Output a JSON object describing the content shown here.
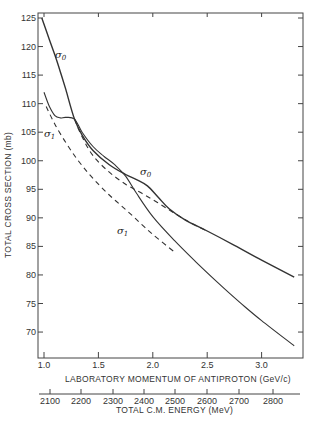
{
  "chart_data": {
    "type": "line",
    "title": "",
    "ylabel": "TOTAL CROSS SECTION (mb)",
    "xlabel": "LABORATORY MOMENTUM OF ANTIPROTON (GeV/c)",
    "x2label": "TOTAL C.M. ENERGY (MeV)",
    "xlim": [
      0.95,
      3.35
    ],
    "ylim": [
      65.5,
      125.5
    ],
    "x_ticks": [
      "1.0",
      "1.5",
      "2.0",
      "2.5",
      "3.0"
    ],
    "y_ticks": [
      "125",
      "120",
      "115",
      "110",
      "105",
      "100",
      "95",
      "90",
      "85",
      "80",
      "75",
      "70"
    ],
    "x2_ticks": [
      "2100",
      "2200",
      "2300",
      "2400",
      "2500",
      "2600",
      "2700",
      "2800"
    ],
    "grid": false,
    "legend": null,
    "annotations": [
      {
        "text": "σ0",
        "x": 1.1,
        "y": 118
      },
      {
        "text": "σ1",
        "x": 1.05,
        "y": 104
      },
      {
        "text": "σ0",
        "x": 1.98,
        "y": 97
      },
      {
        "text": "σ1",
        "x": 1.97,
        "y": 90
      }
    ],
    "series": [
      {
        "name": "σ0 (solid)",
        "style": "solid",
        "x": [
          0.98,
          1.05,
          1.1,
          1.15,
          1.2,
          1.28,
          1.35,
          1.45,
          1.6,
          1.75,
          1.85,
          1.95,
          2.05,
          2.15,
          2.3,
          2.5,
          2.75,
          3.0,
          3.3
        ],
        "y": [
          125,
          121.2,
          118.5,
          115.6,
          112.5,
          107.3,
          104.5,
          101.8,
          99.3,
          97.6,
          96.7,
          95.6,
          93.6,
          91.6,
          89.6,
          87.7,
          85.2,
          82.6,
          79.6
        ]
      },
      {
        "name": "σ0 (dashed)",
        "style": "dashed",
        "x": [
          1.28,
          1.35,
          1.45,
          1.6,
          1.75,
          1.9,
          2.05,
          2.2,
          2.35,
          2.5
        ],
        "y": [
          107.3,
          104.2,
          100.9,
          98.0,
          95.9,
          94.3,
          92.6,
          90.8,
          89.1,
          87.7
        ]
      },
      {
        "name": "σ1 (solid)",
        "style": "solid",
        "x": [
          1.0,
          1.05,
          1.1,
          1.15,
          1.2,
          1.28,
          1.35,
          1.45,
          1.55,
          1.65,
          1.75,
          1.85,
          2.0,
          2.2,
          2.4,
          2.6,
          2.8,
          3.0,
          3.3
        ],
        "y": [
          112.0,
          109.5,
          107.9,
          107.5,
          107.6,
          107.3,
          105.0,
          102.5,
          100.8,
          99.3,
          97.3,
          94.3,
          90.2,
          86.0,
          82.2,
          78.6,
          75.2,
          72.0,
          67.6
        ]
      },
      {
        "name": "σ1 (dashed)",
        "style": "dashed",
        "x": [
          1.02,
          1.1,
          1.2,
          1.3,
          1.4,
          1.5,
          1.6,
          1.7,
          1.8,
          1.9,
          2.0,
          2.2
        ],
        "y": [
          109.5,
          106.4,
          103.2,
          100.4,
          98.0,
          95.9,
          94.0,
          92.3,
          90.6,
          88.8,
          87.1,
          84.0
        ]
      }
    ]
  },
  "axes": {
    "y_title": "TOTAL CROSS SECTION (mb)",
    "x_title": "LABORATORY MOMENTUM OF ANTIPROTON (GeV/c)",
    "x2_title": "TOTAL C.M. ENERGY (MeV)"
  },
  "labels": {
    "sigma_0_left": "σ",
    "sigma_0_left_sub": "0",
    "sigma_1_left": "σ",
    "sigma_1_left_sub": "1",
    "sigma_0_mid": "σ",
    "sigma_0_mid_sub": "0",
    "sigma_1_mid": "σ",
    "sigma_1_mid_sub": "1"
  }
}
